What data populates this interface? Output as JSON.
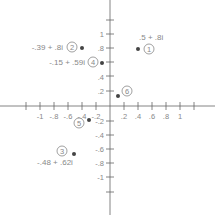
{
  "diagram": {
    "type": "complex-plane",
    "origin_px": [
      110,
      106
    ],
    "unit_px": 70,
    "x_ticks": {
      "negative": [
        "-1",
        "-.8",
        "-.6",
        "-.4",
        "-.2"
      ],
      "positive": [
        ".2",
        ".4",
        ".6",
        ".8",
        "1"
      ]
    },
    "y_ticks": {
      "positive": [
        "1",
        ".8",
        ".6",
        ".4",
        ".2"
      ],
      "negative": [
        "-.2",
        "-.4",
        "-.6",
        "-.8",
        "-1"
      ]
    },
    "points": [
      {
        "id": "1",
        "marker": "1",
        "label": ".5 + .8i",
        "re": 0.5,
        "im": 0.8
      },
      {
        "id": "2",
        "marker": "2",
        "label": "-.39 + .8i",
        "re": -0.39,
        "im": 0.8
      },
      {
        "id": "3",
        "marker": "3",
        "label": "-.48 + .62i",
        "re": -0.48,
        "im": -0.62
      },
      {
        "id": "4",
        "marker": "4",
        "label": "-.15 + .59i",
        "re": -0.15,
        "im": 0.59
      },
      {
        "id": "5",
        "marker": "5",
        "label": "",
        "re": -0.15,
        "im": -0.2
      },
      {
        "id": "6",
        "marker": "6",
        "label": "",
        "re": 0.12,
        "im": 0.14
      }
    ],
    "colors": {
      "axis": "#666666",
      "point": "#444444",
      "text": "#888888"
    }
  }
}
